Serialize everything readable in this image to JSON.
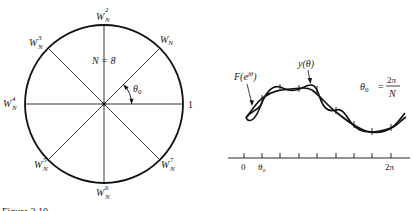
{
  "left_diagram": {
    "n_label": "N = 8",
    "angle_label": "θ",
    "angle_sub": "0",
    "one_label": "1",
    "roots": [
      {
        "base": "W",
        "sub": "N",
        "sup": ""
      },
      {
        "base": "W",
        "sub": "N",
        "sup": "2"
      },
      {
        "base": "W",
        "sub": "N",
        "sup": "3"
      },
      {
        "base": "W",
        "sub": "N",
        "sup": "4"
      },
      {
        "base": "W",
        "sub": "N",
        "sup": "5"
      },
      {
        "base": "W",
        "sub": "N",
        "sup": "6"
      },
      {
        "base": "W",
        "sub": "N",
        "sup": "7"
      }
    ]
  },
  "right_diagram": {
    "curve_f_label_main": "F(e",
    "curve_f_label_sup": "jθ",
    "curve_f_label_close": ")",
    "curve_y_label": "y(θ)",
    "formula_lhs": "θ",
    "formula_lhs_sub": "0",
    "formula_eq": "=",
    "formula_num": "2π",
    "formula_den": "N",
    "axis": {
      "tick_count": 9,
      "label_zero": "0",
      "label_theta": "θ",
      "label_theta_sub": "o",
      "label_end": "2π"
    }
  },
  "caption": "Figure 2.10"
}
